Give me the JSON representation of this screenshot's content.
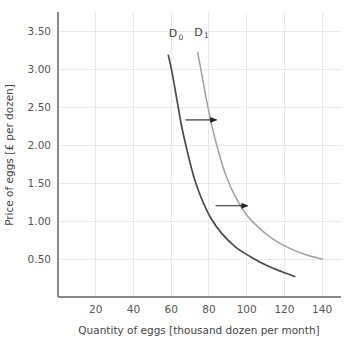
{
  "chart_data": {
    "type": "line",
    "title": "",
    "xlabel": "Quantity of eggs [thousand dozen per month]",
    "ylabel": "Price of eggs [£ per dozen]",
    "xlim": [
      0,
      150
    ],
    "ylim": [
      0,
      3.75
    ],
    "xticks": [
      20,
      40,
      60,
      80,
      100,
      120,
      140
    ],
    "xtick_labels": [
      "20",
      "40",
      "60",
      "80",
      "100",
      "120",
      "140"
    ],
    "yticks": [
      0.5,
      1.0,
      1.5,
      2.0,
      2.5,
      3.0,
      3.5
    ],
    "ytick_labels": [
      "0.50",
      "1.00",
      "1.50",
      "2.00",
      "2.50",
      "3.00",
      "3.50"
    ],
    "grid": true,
    "legend": "none",
    "series": [
      {
        "name": "D0",
        "label": "D",
        "label_sub": "0",
        "color": "#4a4a4a",
        "width": 1.7,
        "label_x": 61,
        "label_y": 3.42,
        "points": [
          {
            "x": 58.5,
            "y": 3.18
          },
          {
            "x": 60.5,
            "y": 2.95
          },
          {
            "x": 63.0,
            "y": 2.6
          },
          {
            "x": 65.5,
            "y": 2.25
          },
          {
            "x": 68.5,
            "y": 1.92
          },
          {
            "x": 72.0,
            "y": 1.58
          },
          {
            "x": 76.0,
            "y": 1.3
          },
          {
            "x": 81.0,
            "y": 1.04
          },
          {
            "x": 87.0,
            "y": 0.83
          },
          {
            "x": 94.0,
            "y": 0.66
          },
          {
            "x": 102.0,
            "y": 0.53
          },
          {
            "x": 111.0,
            "y": 0.41
          },
          {
            "x": 119.0,
            "y": 0.33
          },
          {
            "x": 125.5,
            "y": 0.27
          }
        ]
      },
      {
        "name": "D1",
        "label": "D",
        "label_sub": "1",
        "color": "#a0a0a0",
        "width": 1.5,
        "label_x": 74.5,
        "label_y": 3.44,
        "points": [
          {
            "x": 74.0,
            "y": 3.22
          },
          {
            "x": 76.0,
            "y": 2.96
          },
          {
            "x": 78.5,
            "y": 2.62
          },
          {
            "x": 81.5,
            "y": 2.26
          },
          {
            "x": 85.0,
            "y": 1.92
          },
          {
            "x": 89.0,
            "y": 1.6
          },
          {
            "x": 94.0,
            "y": 1.32
          },
          {
            "x": 100.0,
            "y": 1.08
          },
          {
            "x": 107.0,
            "y": 0.9
          },
          {
            "x": 114.0,
            "y": 0.76
          },
          {
            "x": 122.0,
            "y": 0.65
          },
          {
            "x": 131.0,
            "y": 0.56
          },
          {
            "x": 140.0,
            "y": 0.5
          }
        ]
      }
    ],
    "annotations": [
      {
        "name": "shift-arrow-upper",
        "type": "arrow",
        "x_start": 67.5,
        "x_end": 84.0,
        "y": 2.33,
        "color": "#222222"
      },
      {
        "name": "shift-arrow-lower",
        "type": "arrow",
        "x_start": 83.5,
        "x_end": 100.5,
        "y": 1.2,
        "color": "#222222"
      }
    ],
    "colors": {
      "grid": "#e8e8e8",
      "axis": "#888888",
      "text": "#555555",
      "d0": "#4a4a4a",
      "d1": "#a0a0a0",
      "arrow": "#222222",
      "background": "#ffffff"
    }
  }
}
